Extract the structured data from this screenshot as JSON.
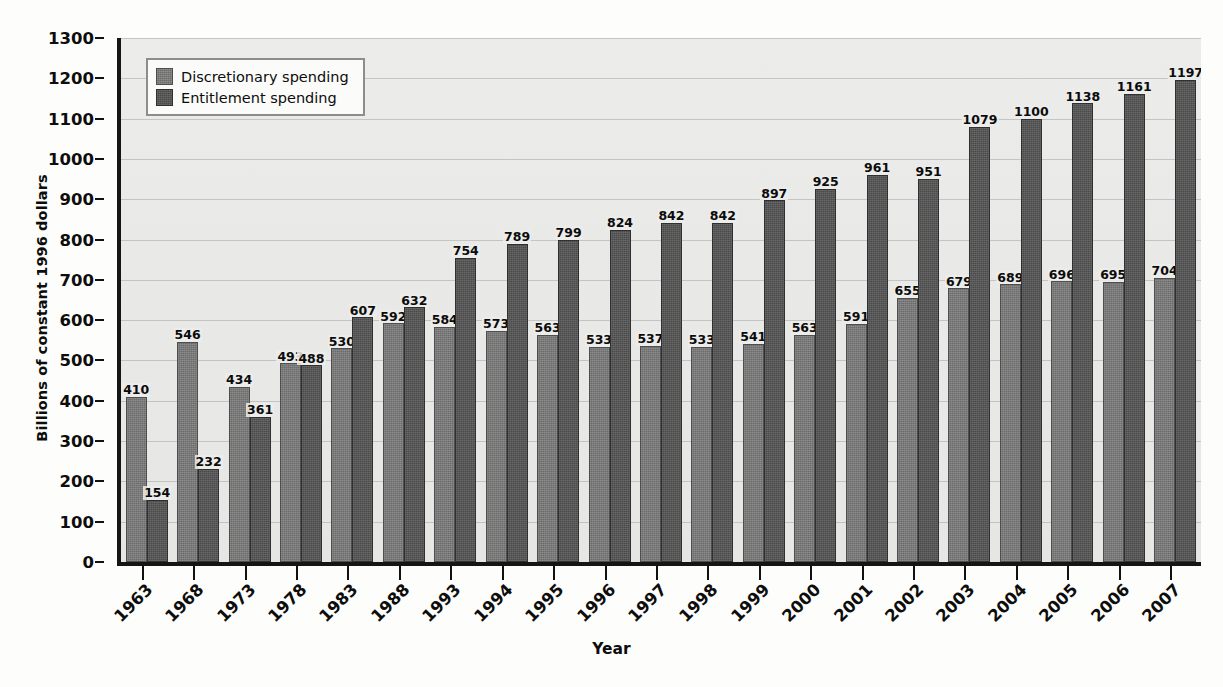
{
  "chart_data": {
    "type": "bar",
    "title": "",
    "xlabel": "Year",
    "ylabel": "Billions of constant 1996 dollars",
    "ylim": [
      0,
      1300
    ],
    "ytick_step": 100,
    "yticks": [
      1300,
      1200,
      1100,
      1000,
      900,
      800,
      700,
      600,
      500,
      400,
      300,
      200,
      100,
      0
    ],
    "grid": true,
    "legend_position": "top-left-inside",
    "categories": [
      "1963",
      "1968",
      "1973",
      "1978",
      "1983",
      "1988",
      "1993",
      "1994",
      "1995",
      "1996",
      "1997",
      "1998",
      "1999",
      "2000",
      "2001",
      "2002",
      "2003",
      "2004",
      "2005",
      "2006",
      "2007"
    ],
    "series": [
      {
        "name": "Discretionary spending",
        "color": "#6b6b6b",
        "values": [
          410,
          546,
          434,
          493,
          530,
          592,
          584,
          573,
          563,
          533,
          537,
          533,
          541,
          563,
          591,
          655,
          679,
          689,
          696,
          695,
          704
        ]
      },
      {
        "name": "Entitlement spending",
        "color": "#4a4a4a",
        "values": [
          154,
          232,
          361,
          488,
          607,
          632,
          754,
          789,
          799,
          824,
          842,
          842,
          897,
          925,
          961,
          951,
          1079,
          1100,
          1138,
          1161,
          1197
        ]
      }
    ]
  },
  "axes": {
    "y_title": "Billions of constant 1996 dollars",
    "x_title": "Year"
  },
  "legend": {
    "entries": [
      {
        "label": "Discretionary spending"
      },
      {
        "label": "Entitlement spending"
      }
    ]
  }
}
